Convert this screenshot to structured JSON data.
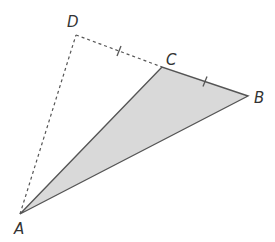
{
  "diagram": {
    "colors": {
      "fill": "#d9d9d9",
      "stroke": "#555555",
      "dashed": "#555555",
      "label": "#333333"
    },
    "points": {
      "A": {
        "label": "A",
        "x": 20,
        "y": 214
      },
      "B": {
        "label": "B",
        "x": 248,
        "y": 96
      },
      "C": {
        "label": "C",
        "x": 162,
        "y": 67
      },
      "D": {
        "label": "D",
        "x": 76,
        "y": 35
      }
    },
    "shaded_polygon": [
      "A",
      "C",
      "B"
    ],
    "solid_segments": [
      [
        "A",
        "C"
      ],
      [
        "C",
        "B"
      ],
      [
        "B",
        "A"
      ]
    ],
    "dashed_segments": [
      [
        "A",
        "D"
      ],
      [
        "D",
        "C"
      ]
    ],
    "equal_length_marks": [
      {
        "segment": [
          "D",
          "C"
        ],
        "ticks": 1
      },
      {
        "segment": [
          "C",
          "B"
        ],
        "ticks": 1
      }
    ]
  }
}
